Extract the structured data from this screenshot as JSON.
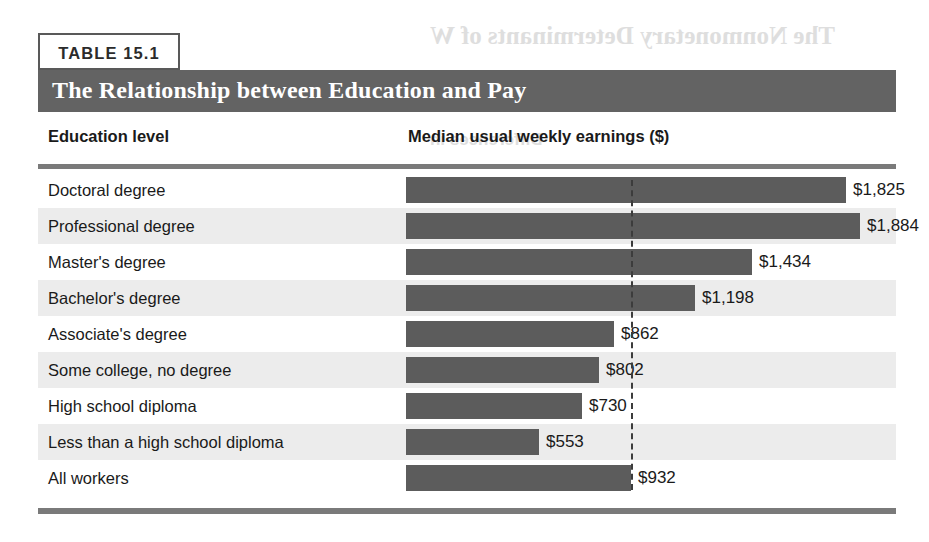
{
  "table": {
    "number_label": "TABLE 15.1",
    "title": "The Relationship between Education and Pay",
    "columns": {
      "education": "Education level",
      "earnings": "Median usual weekly earnings ($)"
    }
  },
  "ghost_text": {
    "line1": "The Nonmonetary Determinants of W",
    "line2": "Differences in",
    "line3": "Human Capital",
    "line4": "from 2008 to 2015",
    "line5": "How Should Education"
  },
  "colors": {
    "band": "#636363",
    "bar": "#5c5c5c",
    "rule": "#7a7a7a",
    "row_alt": "#ececec",
    "text": "#1a1a1a",
    "reference_line": "#3c3c3c"
  },
  "chart_data": {
    "type": "bar",
    "orientation": "horizontal",
    "title": "The Relationship between Education and Pay",
    "xlabel": "Median usual weekly earnings ($)",
    "ylabel": "Education level",
    "grid": false,
    "legend": null,
    "xlim": [
      0,
      1884
    ],
    "value_prefix": "$",
    "reference_line": {
      "value": 932,
      "label": "$932",
      "style": "dashed",
      "refers_to": "All workers"
    },
    "categories": [
      "Doctoral degree",
      "Professional degree",
      "Master's degree",
      "Bachelor's degree",
      "Associate's degree",
      "Some college, no degree",
      "High school diploma",
      "Less than a high school diploma",
      "All workers"
    ],
    "values": [
      1825,
      1884,
      1434,
      1198,
      862,
      802,
      730,
      553,
      932
    ],
    "value_labels": [
      "$1,825",
      "$1,884",
      "$1,434",
      "$1,198",
      "$862",
      "$802",
      "$730",
      "$553",
      "$932"
    ]
  }
}
